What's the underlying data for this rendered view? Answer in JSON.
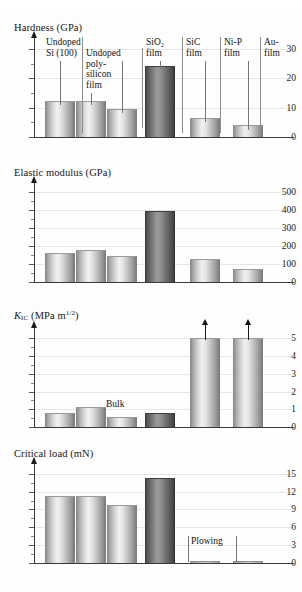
{
  "figure": {
    "background": "#ffffff",
    "bar_color_light": "#d8d8d8",
    "bar_color_dark": "#6e6e6e"
  },
  "samples": [
    {
      "id": "undoped-si-100",
      "label_lines": [
        "Undoped",
        "Si (100)"
      ]
    },
    {
      "id": "undoped-polysilicon-film",
      "label_lines": [
        "Undoped",
        "poly-",
        "silicon",
        "film"
      ]
    },
    {
      "id": "sio2-film",
      "label_lines": [
        "SiO2",
        "film"
      ]
    },
    {
      "id": "sic-film",
      "label_lines": [
        "SiC",
        "film"
      ]
    },
    {
      "id": "ni-p-film",
      "label_lines": [
        "Ni-P",
        "film"
      ]
    },
    {
      "id": "au-film",
      "label_lines": [
        "Au-",
        "film"
      ]
    }
  ],
  "callouts": {
    "undoped_si_line1": "Undoped",
    "undoped_si_line2": "Si (100)",
    "poly_line1": "Undoped",
    "poly_line2": "poly-",
    "poly_line3": "silicon",
    "poly_line4": "film",
    "sio2_line1": "SiO",
    "sio2_sub": "2",
    "sio2_line2": "film",
    "sic_line1": "SiC",
    "sic_line2": "film",
    "nip_line1": "Ni-P",
    "nip_line2": "film",
    "au_line1": "Au-",
    "au_line2": "film",
    "bulk": "Bulk",
    "plowing": "Plowing"
  },
  "charts": [
    {
      "key": "hardness",
      "title": "Hardness (GPa)",
      "ylabel": "Hardness (GPa)",
      "unit": "GPa",
      "ticks": [
        "0",
        "10",
        "20",
        "30"
      ]
    },
    {
      "key": "elastic_modulus",
      "title": "Elastic modulus (GPa)",
      "ylabel": "Elastic modulus (GPa)",
      "unit": "GPa",
      "ticks": [
        "0",
        "100",
        "200",
        "300",
        "400",
        "500"
      ]
    },
    {
      "key": "fracture_toughness",
      "title_prefix": "K",
      "title_sub": "IC",
      "title_mid": " (MPa m",
      "title_sup": "1/2",
      "title_suffix": ")",
      "title": "KIC (MPa m1/2)",
      "unit": "MPa m^1/2",
      "ticks": [
        "0",
        "1",
        "2",
        "3",
        "4",
        "5"
      ]
    },
    {
      "key": "critical_load",
      "title": "Critical load (mN)",
      "ylabel": "Critical load (mN)",
      "unit": "mN",
      "ticks": [
        "0",
        "3",
        "6",
        "9",
        "12",
        "15"
      ]
    }
  ],
  "chart_data": [
    {
      "type": "bar",
      "title": "Hardness (GPa)",
      "xlabel": "",
      "ylabel": "Hardness (GPa)",
      "ylim": [
        0,
        32
      ],
      "yticks": [
        0,
        10,
        20,
        30
      ],
      "grid": true,
      "categories": [
        "Undoped Si (100)",
        "Undoped poly-silicon film",
        "SiO2 film",
        "SiC film",
        "Ni-P film",
        "Au-film"
      ],
      "values": [
        12.2,
        12.2,
        9.5,
        24.2,
        6.4,
        4.0
      ],
      "highlight_index": 3,
      "annotations": []
    },
    {
      "type": "bar",
      "title": "Elastic modulus (GPa)",
      "xlabel": "",
      "ylabel": "Elastic modulus (GPa)",
      "ylim": [
        0,
        520
      ],
      "yticks": [
        0,
        100,
        200,
        300,
        400,
        500
      ],
      "grid": true,
      "categories": [
        "Undoped Si (100)",
        "Undoped poly-silicon film",
        "SiO2 film",
        "SiC film",
        "Ni-P film",
        "Au-film"
      ],
      "values": [
        163,
        175,
        144,
        395,
        127,
        72
      ],
      "highlight_index": 3,
      "annotations": []
    },
    {
      "type": "bar",
      "title": "KIC (MPa m1/2)",
      "xlabel": "",
      "ylabel": "KIC (MPa m^1/2)",
      "ylim": [
        0,
        5.3
      ],
      "yticks": [
        0,
        1,
        2,
        3,
        4,
        5
      ],
      "grid": true,
      "categories": [
        "Undoped Si (100)",
        "Undoped poly-silicon film",
        "SiO2 film",
        "SiC film",
        "Ni-P film",
        "Au-film"
      ],
      "values": [
        0.78,
        1.15,
        0.58,
        0.8,
        5.0,
        5.0
      ],
      "highlight_index": 3,
      "arrows_above": [
        4,
        5
      ],
      "annotations": [
        {
          "text": "Bulk",
          "category": "SiO2 film"
        }
      ]
    },
    {
      "type": "bar",
      "title": "Critical load (mN)",
      "xlabel": "",
      "ylabel": "Critical load (mN)",
      "ylim": [
        0,
        15.8
      ],
      "yticks": [
        0,
        3,
        6,
        9,
        12,
        15
      ],
      "grid": true,
      "categories": [
        "Undoped Si (100)",
        "Undoped poly-silicon film",
        "SiO2 film",
        "SiC film",
        "Ni-P film",
        "Au-film"
      ],
      "values": [
        11.3,
        11.3,
        9.7,
        14.3,
        0.3,
        0.35
      ],
      "highlight_index": 3,
      "annotations": [
        {
          "text": "Plowing",
          "categories": [
            "Ni-P film",
            "Au-film"
          ]
        }
      ]
    }
  ]
}
